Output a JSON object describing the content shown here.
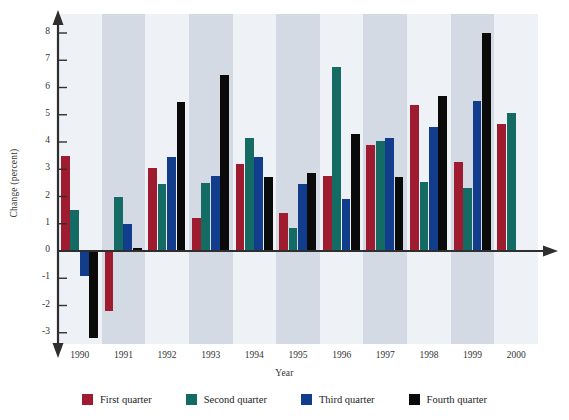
{
  "chart_data": {
    "type": "bar",
    "title": "",
    "xlabel": "Year",
    "ylabel": "Change (percent)",
    "categories": [
      "1990",
      "1991",
      "1992",
      "1993",
      "1994",
      "1995",
      "1996",
      "1997",
      "1998",
      "1999",
      "2000"
    ],
    "ylim": [
      -3.6,
      8.4
    ],
    "yticks": [
      8,
      7,
      6,
      5,
      4,
      3,
      2,
      1,
      0,
      -1,
      -2,
      -3
    ],
    "ytick_labels": [
      "8",
      "7",
      "6",
      "5",
      "4",
      "3",
      "2",
      "1",
      "0",
      "-1",
      "-2",
      "-3"
    ],
    "grid": false,
    "legend_position": "bottom",
    "series": [
      {
        "name": "First quarter",
        "color": "#9e1b30",
        "values": [
          3.5,
          -2.2,
          3.05,
          1.2,
          3.2,
          1.4,
          2.75,
          3.9,
          5.35,
          3.25,
          4.65
        ]
      },
      {
        "name": "Second quarter",
        "color": "#146b63",
        "values": [
          1.5,
          2.0,
          2.45,
          2.5,
          4.15,
          0.85,
          6.75,
          4.05,
          2.55,
          2.3,
          5.05
        ]
      },
      {
        "name": "Third quarter",
        "color": "#123c8c",
        "values": [
          -0.9,
          1.0,
          3.45,
          2.75,
          3.45,
          2.45,
          1.9,
          4.15,
          4.55,
          5.5,
          null
        ]
      },
      {
        "name": "Fourth quarter",
        "color": "#0a0a0a",
        "values": [
          -3.2,
          0.1,
          5.45,
          6.45,
          2.7,
          2.85,
          4.3,
          2.7,
          5.7,
          8.0,
          null
        ]
      }
    ],
    "band_colors": [
      "#eef2f7",
      "#d3dae3"
    ],
    "axis_color": "#2f2f2f"
  },
  "legend": {
    "items": [
      {
        "label": "First quarter",
        "color": "#9e1b30"
      },
      {
        "label": "Second quarter",
        "color": "#146b63"
      },
      {
        "label": "Third quarter",
        "color": "#123c8c"
      },
      {
        "label": "Fourth quarter",
        "color": "#0a0a0a"
      }
    ]
  }
}
